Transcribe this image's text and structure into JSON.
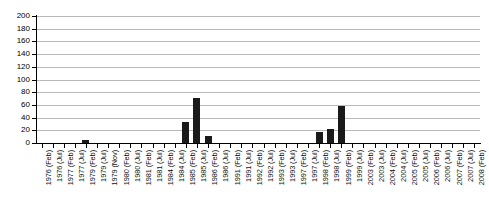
{
  "chart_data": {
    "type": "bar",
    "title": "",
    "subtitle": "",
    "xlabel": "",
    "ylabel": "",
    "ylim": [
      0,
      200
    ],
    "ytick_step": 20,
    "grid": true,
    "legend": false,
    "legend_position": "none",
    "bar_color": "#1a1a1a",
    "gridline_color": "#b9b9b9",
    "axis_color": "#000000",
    "yticks": [
      0,
      20,
      40,
      60,
      80,
      100,
      120,
      140,
      160,
      180,
      200
    ],
    "categories": [
      "1976 (Feb)",
      "1976 (Jul)",
      "1977 (Feb)",
      "1977 (Jul)",
      "1979 (Feb)",
      "1979 (Jul)",
      "1979 (Nov)",
      "1980 (Feb)",
      "1980 (Jul)",
      "1981 (Feb)",
      "1981 (Jul)",
      "1984 (Feb)",
      "1984 (Jul)",
      "1985 (Feb)",
      "1985 (Jul)",
      "1986 (Feb)",
      "1986 (Jul)",
      "1991 (Feb)",
      "1991 (Jul)",
      "1992 (Feb)",
      "1992 (Jul)",
      "1993 (Feb)",
      "1993 (Jul)",
      "1997 (Feb)",
      "1997 (Jul)",
      "1998 (Feb)",
      "1998 (Jul)",
      "1999 (Feb)",
      "1999 (Jul)",
      "2003 (Feb)",
      "2003 (Jul)",
      "2004 (Feb)",
      "2004 (Jul)",
      "2005 (Feb)",
      "2005 (Jul)",
      "2006 (Feb)",
      "2006 (Jul)",
      "2007 (Feb)",
      "2007 (Jul)",
      "2008 (Feb)"
    ],
    "values": [
      0,
      0,
      0,
      0,
      4,
      0,
      0,
      0,
      0,
      0,
      0,
      0,
      0,
      33,
      71,
      11,
      0,
      0,
      0,
      0,
      0,
      0,
      0,
      0,
      0,
      18,
      22,
      58,
      0,
      0,
      0,
      0,
      0,
      0,
      0,
      0,
      0,
      0,
      0,
      0
    ]
  }
}
